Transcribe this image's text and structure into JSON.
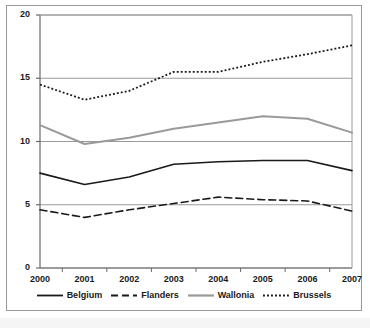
{
  "chart_data": {
    "type": "line",
    "title": "",
    "xlabel": "",
    "ylabel": "",
    "x": [
      2000,
      2001,
      2002,
      2003,
      2004,
      2005,
      2006,
      2007
    ],
    "categories": [
      "2000",
      "2001",
      "2002",
      "2003",
      "2004",
      "2005",
      "2006",
      "2007"
    ],
    "series": [
      {
        "name": "Belgium",
        "style": "solid",
        "color": "#1a1a1a",
        "width": 1.6,
        "values": [
          7.5,
          6.6,
          7.2,
          8.2,
          8.4,
          8.5,
          8.5,
          7.7
        ]
      },
      {
        "name": "Flanders",
        "style": "dashed",
        "color": "#1a1a1a",
        "width": 1.6,
        "values": [
          4.6,
          4.0,
          4.6,
          5.1,
          5.6,
          5.4,
          5.3,
          4.5
        ]
      },
      {
        "name": "Wallonia",
        "style": "solid",
        "color": "#9a9a9a",
        "width": 2.0,
        "values": [
          11.3,
          9.8,
          10.3,
          11.0,
          11.5,
          12.0,
          11.8,
          10.7
        ]
      },
      {
        "name": "Brussels",
        "style": "dotted",
        "color": "#1a1a1a",
        "width": 1.8,
        "values": [
          14.5,
          13.3,
          14.0,
          15.5,
          15.5,
          16.3,
          16.9,
          17.6
        ]
      }
    ],
    "ylim": [
      0,
      20
    ],
    "yticks": [
      0,
      5,
      10,
      15,
      20
    ],
    "ytick_labels": [
      "0",
      "5",
      "10",
      "15",
      "20"
    ],
    "xlim": [
      2000,
      2007
    ],
    "grid": "horizontal",
    "legend_position": "bottom",
    "legend_entries": [
      "Belgium",
      "Flanders",
      "Wallonia",
      "Brussels"
    ]
  },
  "colors": {
    "axis": "#6b6b6b",
    "gridline": "#9a9a9a",
    "frame": "#9a9a9a",
    "dark_series": "#1a1a1a",
    "gray_series": "#9a9a9a",
    "background": "#ffffff",
    "text": "#1a1a1a"
  }
}
